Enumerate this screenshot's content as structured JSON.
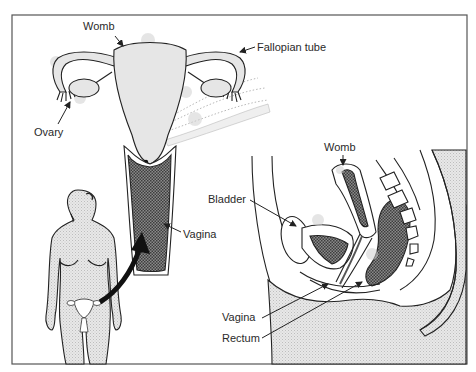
{
  "diagram": {
    "frame": {
      "x": 12,
      "y": 15,
      "width": 455,
      "height": 349,
      "stroke": "#555555"
    },
    "colors": {
      "tissue": "#e4e4e4",
      "dark_tissue": "#555555",
      "line": "#222222",
      "background": "#ffffff"
    },
    "front_view": {
      "labels": {
        "womb": "Womb",
        "fallopian_tube": "Fallopian tube",
        "ovary": "Ovary",
        "vagina": "Vagina"
      }
    },
    "side_view": {
      "labels": {
        "womb": "Womb",
        "bladder": "Bladder",
        "vagina": "Vagina",
        "rectum": "Rectum"
      }
    },
    "figure": {
      "description": "Standing female figure with organ location marked",
      "arrow": "curved-arrow pointing from pelvis to enlarged front view"
    }
  }
}
